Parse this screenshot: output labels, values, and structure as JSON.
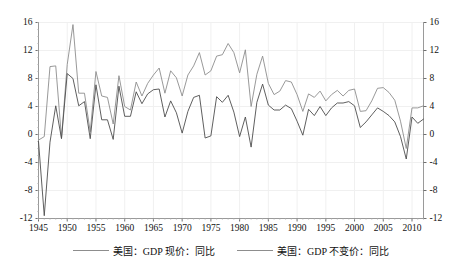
{
  "chart_data": {
    "type": "line",
    "title": "",
    "subtitle": "",
    "xlabel": "",
    "ylabel": "",
    "xlim": [
      1945,
      2012
    ],
    "ylim": [
      -12,
      16
    ],
    "y_ticks": [
      16,
      12,
      8,
      4,
      0,
      -4,
      -8,
      -12
    ],
    "y_ticks_right": [
      16,
      12,
      8,
      4,
      0,
      -4,
      -8,
      -12
    ],
    "x_ticks": [
      1945,
      1950,
      1955,
      1960,
      1965,
      1970,
      1975,
      1980,
      1985,
      1990,
      1995,
      2000,
      2005,
      2010
    ],
    "grid": true,
    "grid_color": "#f0f0f0",
    "legend_position": "bottom",
    "dual_axis": true,
    "x": [
      1945,
      1946,
      1947,
      1948,
      1949,
      1950,
      1951,
      1952,
      1953,
      1954,
      1955,
      1956,
      1957,
      1958,
      1959,
      1960,
      1961,
      1962,
      1963,
      1964,
      1965,
      1966,
      1967,
      1968,
      1969,
      1970,
      1971,
      1972,
      1973,
      1974,
      1975,
      1976,
      1977,
      1978,
      1979,
      1980,
      1981,
      1982,
      1983,
      1984,
      1985,
      1986,
      1987,
      1988,
      1989,
      1990,
      1991,
      1992,
      1993,
      1994,
      1995,
      1996,
      1997,
      1998,
      1999,
      2000,
      2001,
      2002,
      2003,
      2004,
      2005,
      2006,
      2007,
      2008,
      2009,
      2010,
      2011,
      2012
    ],
    "series": [
      {
        "name": "美国：GDP 现价：同比",
        "color": "#8d8d8d",
        "width": 0.9,
        "values": [
          -0.8,
          -0.3,
          9.7,
          9.8,
          -0.5,
          10.0,
          15.7,
          5.9,
          5.9,
          0.4,
          9.0,
          5.5,
          5.3,
          1.5,
          8.4,
          4.0,
          3.5,
          7.5,
          5.5,
          7.3,
          8.5,
          9.5,
          5.9,
          9.1,
          8.1,
          5.5,
          8.5,
          9.8,
          11.7,
          8.5,
          9.1,
          11.2,
          11.4,
          13.0,
          11.7,
          8.8,
          12.1,
          4.0,
          8.6,
          11.2,
          7.3,
          5.7,
          6.2,
          7.7,
          7.5,
          5.7,
          3.3,
          5.8,
          5.3,
          6.2,
          4.8,
          5.7,
          6.3,
          5.5,
          6.3,
          6.5,
          3.3,
          3.4,
          4.8,
          6.6,
          6.7,
          6.0,
          4.9,
          1.9,
          -2.0,
          3.8,
          3.8,
          4.1
        ]
      },
      {
        "name": "美国：GDP 不变价：同比",
        "color": "#4d4d4d",
        "width": 0.9,
        "values": [
          -1.0,
          -11.6,
          -1.1,
          4.1,
          -0.6,
          8.7,
          8.0,
          4.1,
          4.7,
          -0.6,
          7.1,
          2.1,
          2.1,
          -0.7,
          6.9,
          2.6,
          2.6,
          6.1,
          4.4,
          5.8,
          6.4,
          6.5,
          2.5,
          4.8,
          3.1,
          0.2,
          3.3,
          5.3,
          5.6,
          -0.5,
          -0.2,
          5.4,
          4.6,
          5.6,
          3.2,
          -0.3,
          2.5,
          -1.8,
          4.6,
          7.2,
          4.2,
          3.5,
          3.5,
          4.2,
          3.7,
          1.9,
          -0.1,
          3.6,
          2.7,
          4.0,
          2.7,
          3.8,
          4.5,
          4.5,
          4.7,
          4.1,
          1.0,
          1.8,
          2.8,
          3.8,
          3.3,
          2.7,
          1.8,
          -0.3,
          -3.5,
          2.5,
          1.6,
          2.2
        ]
      }
    ]
  },
  "legend": [
    {
      "label": "美国：GDP 现价：同比",
      "color": "#8d8d8d"
    },
    {
      "label": "美国：GDP 不变价：同比",
      "color": "#8d8d8d"
    }
  ],
  "axes": {
    "left_ticks": [
      "16",
      "12",
      "8",
      "4",
      "0",
      "-4",
      "-8",
      "-12"
    ],
    "right_ticks": [
      "16",
      "12",
      "8",
      "4",
      "0",
      "-4",
      "-8",
      "-12"
    ],
    "x_ticks": [
      "1945",
      "1950",
      "1955",
      "1960",
      "1965",
      "1970",
      "1975",
      "1980",
      "1985",
      "1990",
      "1995",
      "2000",
      "2005",
      "2010"
    ]
  }
}
